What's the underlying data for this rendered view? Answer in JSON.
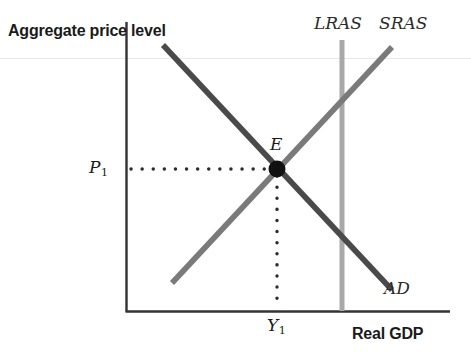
{
  "figure": {
    "type": "macroeconomic-equilibrium-diagram",
    "background_color": "#ffffff"
  },
  "axes": {
    "y_title": "Aggregate price level",
    "x_title": "Real GDP",
    "axis_color": "#333333",
    "origin_px": {
      "x": 126,
      "y": 311
    },
    "y_axis_top_px": 22,
    "x_axis_right_px": 450
  },
  "curves": [
    {
      "name": "AD",
      "label": "AD",
      "kind": "aggregate-demand",
      "slope": "downward",
      "color": "#4a4a4a",
      "start_px": {
        "x": 163,
        "y": 45
      },
      "end_px": {
        "x": 392,
        "y": 290
      }
    },
    {
      "name": "SRAS",
      "label": "SRAS",
      "kind": "short-run-aggregate-supply",
      "slope": "upward",
      "color": "#7a7a7a",
      "start_px": {
        "x": 172,
        "y": 283
      },
      "end_px": {
        "x": 392,
        "y": 47
      }
    },
    {
      "name": "LRAS",
      "label": "LRAS",
      "kind": "long-run-aggregate-supply",
      "slope": "vertical",
      "color": "#a8a8a8",
      "start_px": {
        "x": 342,
        "y": 40
      },
      "end_px": {
        "x": 342,
        "y": 311
      }
    }
  ],
  "equilibrium": {
    "point_label": "E",
    "price_label": "P",
    "price_subscript": "1",
    "output_label": "Y",
    "output_subscript": "1",
    "point_px": {
      "x": 277,
      "y": 169
    },
    "dot_color": "#111111",
    "guide_color": "#2b2b2b"
  },
  "chart_data": {
    "type": "line",
    "title": "",
    "xlabel": "Real GDP",
    "ylabel": "Aggregate price level",
    "xlim": [
      0,
      100
    ],
    "ylim": [
      0,
      100
    ],
    "grid": false,
    "legend": "inline-curve-labels",
    "series": [
      {
        "name": "AD",
        "label": "AD",
        "x": [
          11.4,
          82.0
        ],
        "y": [
          91.4,
          7.2
        ]
      },
      {
        "name": "SRAS",
        "label": "SRAS",
        "x": [
          14.2,
          82.0
        ],
        "y": [
          9.6,
          90.7
        ]
      },
      {
        "name": "LRAS",
        "label": "LRAS",
        "x": [
          66.7,
          66.7
        ],
        "y": [
          93.1,
          0.0
        ]
      }
    ],
    "annotations": [
      {
        "text": "E",
        "x": 46.6,
        "y": 48.8,
        "type": "equilibrium-point"
      },
      {
        "text": "P1",
        "x": 0.0,
        "y": 48.8,
        "type": "y-axis-value"
      },
      {
        "text": "Y1",
        "x": 46.6,
        "y": 0.0,
        "type": "x-axis-value"
      }
    ],
    "equilibrium_point": {
      "x": 46.6,
      "y": 48.8
    }
  }
}
